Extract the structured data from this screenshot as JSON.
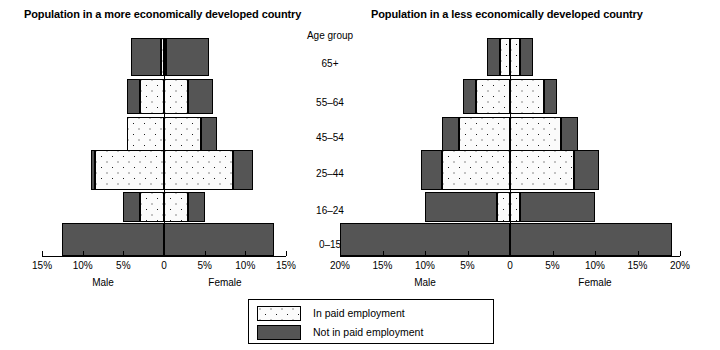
{
  "figure": {
    "age_group_header": "Age group",
    "legend": {
      "items": [
        {
          "label": "In paid employment",
          "pattern": "dots"
        },
        {
          "label": "Not in paid employment",
          "pattern": "dark"
        }
      ]
    },
    "colors": {
      "not_in_paid_employment": "#555555",
      "in_paid_employment_fill": "#fbfbfb",
      "in_paid_employment_dots": "#1a1a1a",
      "axis": "#000000"
    },
    "age_groups": [
      "65+",
      "55–64",
      "45–54",
      "25–44",
      "16–24",
      "0–15"
    ]
  },
  "chart_data": [
    {
      "id": "medc",
      "type": "bar",
      "orientation": "population-pyramid",
      "title": "Population in a more economically developed country",
      "categories": [
        "65+",
        "55–64",
        "45–54",
        "25–44",
        "16–24",
        "0–15"
      ],
      "ylabel": "Age group",
      "xlabel": "",
      "sides": [
        "Male",
        "Female"
      ],
      "xlim": [
        -15,
        15
      ],
      "xticks": [
        -15,
        -10,
        -5,
        0,
        5,
        10,
        15
      ],
      "xticklabels": [
        "15%",
        "10%",
        "5%",
        "0",
        "5%",
        "10%",
        "15%"
      ],
      "unit": "%",
      "grid": false,
      "legend_position": "below-centre",
      "series": [
        {
          "name": "In paid employment",
          "side": "Male",
          "values": [
            0.4,
            3.0,
            4.5,
            8.5,
            3.0,
            0.0
          ]
        },
        {
          "name": "Not in paid employment",
          "side": "Male",
          "values": [
            3.6,
            1.5,
            0.0,
            0.5,
            2.0,
            12.5
          ]
        },
        {
          "name": "In paid employment",
          "side": "Female",
          "values": [
            0.3,
            3.0,
            4.5,
            8.5,
            3.0,
            0.0
          ]
        },
        {
          "name": "Not in paid employment",
          "side": "Female",
          "values": [
            5.2,
            3.0,
            2.0,
            2.5,
            2.0,
            13.5
          ]
        }
      ]
    },
    {
      "id": "ledc",
      "type": "bar",
      "orientation": "population-pyramid",
      "title": "Population in a less economically developed country",
      "categories": [
        "65+",
        "55–64",
        "45–54",
        "25–44",
        "16–24",
        "0–15"
      ],
      "ylabel": "Age group",
      "xlabel": "",
      "sides": [
        "Male",
        "Female"
      ],
      "xlim": [
        -20,
        20
      ],
      "xticks": [
        -20,
        -15,
        -10,
        -5,
        0,
        5,
        10,
        15,
        20
      ],
      "xticklabels": [
        "20%",
        "15%",
        "10%",
        "5%",
        "0",
        "5%",
        "10%",
        "15%",
        "20%"
      ],
      "unit": "%",
      "grid": false,
      "legend_position": "below-centre",
      "series": [
        {
          "name": "In paid employment",
          "side": "Male",
          "values": [
            1.2,
            4.0,
            6.0,
            8.0,
            1.5,
            0.0
          ]
        },
        {
          "name": "Not in paid employment",
          "side": "Male",
          "values": [
            1.5,
            1.5,
            2.0,
            2.5,
            8.5,
            20.0
          ]
        },
        {
          "name": "In paid employment",
          "side": "Female",
          "values": [
            1.2,
            4.0,
            6.0,
            7.5,
            1.2,
            0.0
          ]
        },
        {
          "name": "Not in paid employment",
          "side": "Female",
          "values": [
            1.5,
            1.5,
            2.0,
            3.0,
            8.8,
            19.0
          ]
        }
      ]
    }
  ]
}
